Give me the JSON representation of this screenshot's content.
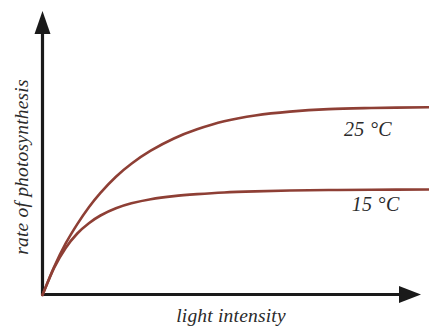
{
  "figure": {
    "width": 429,
    "height": 333,
    "background_color": "#ffffff"
  },
  "chart_data": {
    "type": "line",
    "title": "",
    "subtitle": "",
    "xlabel": "light intensity",
    "ylabel": "rate of photosynthesis",
    "xlim": [
      0,
      1
    ],
    "ylim": [
      0,
      1
    ],
    "grid": false,
    "legend_position": "inline-right",
    "axis_tick_labels": {
      "x": [],
      "y": []
    },
    "axis_style": {
      "color": "#1a1a1a",
      "arrowheads": true,
      "origin_label": ""
    },
    "series": [
      {
        "name": "25 °C",
        "label": "25 °C",
        "color": "#8e3f35",
        "plateau_value": 0.655,
        "half_saturation_x": 0.165,
        "initial_slope": 3.97,
        "x": [
          0.0,
          0.03,
          0.06,
          0.09,
          0.12,
          0.15,
          0.19,
          0.23,
          0.28,
          0.34,
          0.4,
          0.47,
          0.55,
          0.64,
          0.74,
          0.85,
          1.0
        ],
        "y": [
          0.0,
          0.101,
          0.186,
          0.256,
          0.317,
          0.369,
          0.427,
          0.474,
          0.521,
          0.565,
          0.598,
          0.627,
          0.648,
          0.662,
          0.671,
          0.675,
          0.678
        ]
      },
      {
        "name": "15 °C",
        "label": "15 °C",
        "color": "#8e3f35",
        "plateau_value": 0.385,
        "half_saturation_x": 0.093,
        "initial_slope": 3.97,
        "x": [
          0.0,
          0.03,
          0.06,
          0.09,
          0.12,
          0.15,
          0.19,
          0.23,
          0.28,
          0.34,
          0.4,
          0.47,
          0.55,
          0.64,
          0.74,
          0.85,
          1.0
        ],
        "y": [
          0.0,
          0.098,
          0.17,
          0.222,
          0.259,
          0.287,
          0.313,
          0.331,
          0.346,
          0.357,
          0.364,
          0.37,
          0.374,
          0.377,
          0.379,
          0.38,
          0.381
        ]
      }
    ],
    "annotations": [
      {
        "text": "25 °C",
        "x": 0.78,
        "y": 0.575,
        "style": "italic"
      },
      {
        "text": "15 °C",
        "x": 0.8,
        "y": 0.305,
        "style": "italic"
      }
    ]
  }
}
